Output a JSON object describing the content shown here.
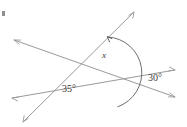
{
  "figure": {
    "type": "geometry-diagram",
    "width": 187,
    "height": 127,
    "background_color": "#ffffff",
    "line_color": "#9a9a9a",
    "arc_color": "#6e6e6e",
    "label_color": "#3a3a3a",
    "labels": {
      "unknown_angle": "x",
      "left_angle": "35°",
      "right_angle": "30°"
    },
    "angle_values": {
      "left_angle_degrees": 35,
      "right_angle_degrees": 30,
      "unknown_angle_degrees": null
    },
    "lines": [
      {
        "id": "line-a",
        "name": "upper-left-to-lower-right-line",
        "from": [
          14,
          40
        ],
        "to": [
          175,
          97
        ],
        "double_headed": true
      },
      {
        "id": "line-b",
        "name": "lower-left-to-upper-right-line",
        "from": [
          23,
          122
        ],
        "to": [
          134,
          12
        ],
        "double_headed": true
      },
      {
        "id": "line-c",
        "name": "left-to-right-shallow-line",
        "from": [
          12,
          98
        ],
        "to": [
          175,
          70
        ],
        "double_headed": true
      }
    ],
    "intersections": [
      {
        "id": "vertex-left",
        "name": "left-vertex-35",
        "point": [
          52,
          84
        ],
        "lines": [
          "line-b",
          "line-c"
        ]
      },
      {
        "id": "vertex-right",
        "name": "right-vertex-30",
        "point": [
          136,
          78
        ],
        "lines": [
          "line-a",
          "line-c"
        ]
      },
      {
        "id": "vertex-top",
        "name": "top-vertex-x",
        "point": [
          116,
          71
        ],
        "lines": [
          "line-a",
          "line-b"
        ]
      }
    ],
    "label_positions": {
      "unknown_angle": [
        104,
        58
      ],
      "left_angle": [
        62,
        92
      ],
      "right_angle": [
        148,
        81
      ]
    },
    "arc": {
      "name": "angle-x-arc",
      "center": [
        116,
        71
      ],
      "radius": 36,
      "has_arrowhead": true,
      "arrowhead_at": [
        107,
        37
      ]
    }
  }
}
